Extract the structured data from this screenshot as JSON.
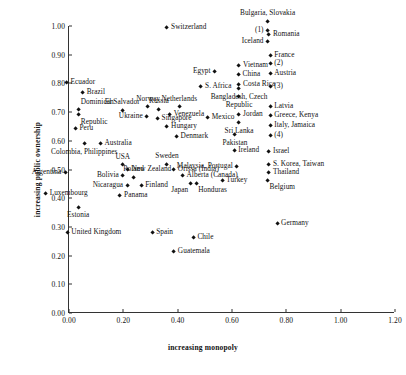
{
  "chart_data": {
    "type": "scatter",
    "title": "",
    "xlabel": "increasing monopoly",
    "ylabel": "increasing public ownership",
    "xlim": [
      0.0,
      1.2
    ],
    "ylim": [
      0.0,
      1.0
    ],
    "xticks": [
      "0.00",
      "0.20",
      "0.40",
      "0.60",
      "0.80",
      "1.00",
      "1.20"
    ],
    "xtick_values": [
      0.0,
      0.2,
      0.4,
      0.6,
      0.8,
      1.0,
      1.2
    ],
    "yticks": [
      "0.00",
      "0.10",
      "0.20",
      "0.30",
      "0.40",
      "0.50",
      "0.60",
      "0.70",
      "0.80",
      "0.90",
      "1.00"
    ],
    "ytick_values": [
      0.0,
      0.1,
      0.2,
      0.3,
      0.4,
      0.5,
      0.6,
      0.7,
      0.8,
      0.9,
      1.0
    ],
    "grid": false,
    "legend": "none",
    "marker": "diamond",
    "marker_color": "#111111",
    "points": [
      {
        "label": "Switzerland",
        "x": 0.615,
        "y": 0.905,
        "pos": "r"
      },
      {
        "label": "Bulgaria, Slovakia",
        "x": 0.985,
        "y": 0.925,
        "pos": "t"
      },
      {
        "label": "(1)",
        "x": 0.985,
        "y": 0.893,
        "pos": "l"
      },
      {
        "label": "Romania",
        "x": 0.99,
        "y": 0.878,
        "pos": "r"
      },
      {
        "label": "Iceland",
        "x": 0.985,
        "y": 0.855,
        "pos": "l"
      },
      {
        "label": "France",
        "x": 0.995,
        "y": 0.808,
        "pos": "r"
      },
      {
        "label": "(2)",
        "x": 0.995,
        "y": 0.778,
        "pos": "r"
      },
      {
        "label": "Vietnam",
        "x": 0.88,
        "y": 0.772,
        "pos": "r"
      },
      {
        "label": "Egypt",
        "x": 0.79,
        "y": 0.752,
        "pos": "l"
      },
      {
        "label": "China",
        "x": 0.878,
        "y": 0.74,
        "pos": "r"
      },
      {
        "label": "Austria",
        "x": 0.995,
        "y": 0.742,
        "pos": "r"
      },
      {
        "label": "Costa Rica",
        "x": 0.88,
        "y": 0.705,
        "pos": "r"
      },
      {
        "label": "S. Africa",
        "x": 0.74,
        "y": 0.7,
        "pos": "r"
      },
      {
        "label": "(3)",
        "x": 0.995,
        "y": 0.7,
        "pos": "r"
      },
      {
        "label": "Bangladesh, Czech",
        "x": 0.88,
        "y": 0.69,
        "pos": "b"
      },
      {
        "label": "Republic",
        "x": 0.88,
        "y": 0.662,
        "pos": "b"
      },
      {
        "label": "Ecuador",
        "x": 0.245,
        "y": 0.712,
        "pos": "r"
      },
      {
        "label": "Brazil",
        "x": 0.305,
        "y": 0.678,
        "pos": "r"
      },
      {
        "label": "El Salvador",
        "x": 0.45,
        "y": 0.615,
        "pos": "t"
      },
      {
        "label": "Dominican",
        "x": 0.29,
        "y": 0.618,
        "pos": "tr"
      },
      {
        "label": "Republic",
        "x": 0.29,
        "y": 0.6,
        "pos": "br"
      },
      {
        "label": "Norway",
        "x": 0.545,
        "y": 0.628,
        "pos": "t"
      },
      {
        "label": "Russia",
        "x": 0.585,
        "y": 0.618,
        "pos": "t"
      },
      {
        "label": "Netherlands",
        "x": 0.66,
        "y": 0.628,
        "pos": "t"
      },
      {
        "label": "Latvia",
        "x": 0.995,
        "y": 0.628,
        "pos": "r"
      },
      {
        "label": "Ukraine",
        "x": 0.54,
        "y": 0.595,
        "pos": "l"
      },
      {
        "label": "Venezuela",
        "x": 0.625,
        "y": 0.6,
        "pos": "r"
      },
      {
        "label": "Mexico",
        "x": 0.765,
        "y": 0.592,
        "pos": "r"
      },
      {
        "label": "Jordan",
        "x": 0.88,
        "y": 0.6,
        "pos": "r"
      },
      {
        "label": "Greece, Kenya",
        "x": 0.995,
        "y": 0.598,
        "pos": "r"
      },
      {
        "label": "Singapore",
        "x": 0.58,
        "y": 0.588,
        "pos": "r"
      },
      {
        "label": "Sri Lanka",
        "x": 0.88,
        "y": 0.572,
        "pos": "b"
      },
      {
        "label": "Peru",
        "x": 0.278,
        "y": 0.553,
        "pos": "r"
      },
      {
        "label": "Hungary",
        "x": 0.615,
        "y": 0.558,
        "pos": "r"
      },
      {
        "label": "Italy, Jamaica",
        "x": 0.995,
        "y": 0.562,
        "pos": "r"
      },
      {
        "label": "Denmark",
        "x": 0.65,
        "y": 0.523,
        "pos": "r"
      },
      {
        "label": "Pakistan",
        "x": 0.865,
        "y": 0.53,
        "pos": "b"
      },
      {
        "label": "(4)",
        "x": 0.995,
        "y": 0.528,
        "pos": "r"
      },
      {
        "label": "Australia",
        "x": 0.37,
        "y": 0.5,
        "pos": "r"
      },
      {
        "label": "Colombia, Philippines",
        "x": 0.31,
        "y": 0.498,
        "pos": "b"
      },
      {
        "label": "Ireland",
        "x": 0.862,
        "y": 0.475,
        "pos": "r"
      },
      {
        "label": "Israel",
        "x": 0.99,
        "y": 0.472,
        "pos": "r"
      },
      {
        "label": "USA",
        "x": 0.452,
        "y": 0.425,
        "pos": "t"
      },
      {
        "label": "New Zealand",
        "x": 0.47,
        "y": 0.408,
        "pos": "r"
      },
      {
        "label": "Sweden",
        "x": 0.615,
        "y": 0.428,
        "pos": "t"
      },
      {
        "label": "Malaysia, Portugal",
        "x": 0.872,
        "y": 0.42,
        "pos": "l"
      },
      {
        "label": "S. Korea, Taiwan",
        "x": 0.99,
        "y": 0.425,
        "pos": "r"
      },
      {
        "label": "Argentina",
        "x": 0.24,
        "y": 0.4,
        "pos": "l"
      },
      {
        "label": "Bolivia",
        "x": 0.452,
        "y": 0.388,
        "pos": "l"
      },
      {
        "label": "Poland",
        "x": 0.492,
        "y": 0.382,
        "pos": "t"
      },
      {
        "label": "Orissa (India)",
        "x": 0.64,
        "y": 0.408,
        "pos": "r"
      },
      {
        "label": "Alberta (Canada)",
        "x": 0.672,
        "y": 0.388,
        "pos": "r"
      },
      {
        "label": "Thailand",
        "x": 0.99,
        "y": 0.398,
        "pos": "r"
      },
      {
        "label": "Nicaragua",
        "x": 0.468,
        "y": 0.355,
        "pos": "l"
      },
      {
        "label": "Finland",
        "x": 0.52,
        "y": 0.352,
        "pos": "r"
      },
      {
        "label": "Japan",
        "x": 0.7,
        "y": 0.362,
        "pos": "bl"
      },
      {
        "label": "Honduras",
        "x": 0.722,
        "y": 0.362,
        "pos": "br"
      },
      {
        "label": "Turkey",
        "x": 0.818,
        "y": 0.372,
        "pos": "r"
      },
      {
        "label": "Belgium",
        "x": 0.985,
        "y": 0.372,
        "pos": "br"
      },
      {
        "label": "Luxembourg",
        "x": 0.168,
        "y": 0.325,
        "pos": "r"
      },
      {
        "label": "Panama",
        "x": 0.442,
        "y": 0.318,
        "pos": "r"
      },
      {
        "label": "Estonia",
        "x": 0.288,
        "y": 0.278,
        "pos": "b"
      },
      {
        "label": "Germany",
        "x": 1.02,
        "y": 0.222,
        "pos": "r"
      },
      {
        "label": "United Kingdom",
        "x": 0.248,
        "y": 0.19,
        "pos": "r"
      },
      {
        "label": "Spain",
        "x": 0.56,
        "y": 0.188,
        "pos": "r"
      },
      {
        "label": "Chile",
        "x": 0.712,
        "y": 0.172,
        "pos": "r"
      },
      {
        "label": "Guatemala",
        "x": 0.64,
        "y": 0.122,
        "pos": "r"
      }
    ]
  }
}
